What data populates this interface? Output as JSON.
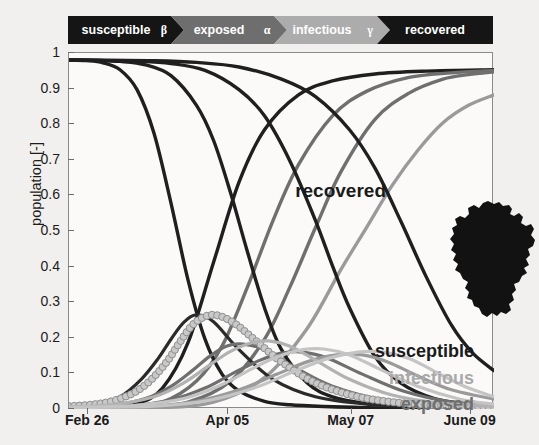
{
  "flow": {
    "stages": [
      {
        "name": "susceptible",
        "label": "susceptible",
        "param": "β",
        "color": "#151515"
      },
      {
        "name": "exposed",
        "label": "exposed",
        "param": "α",
        "color": "#6e6e6e"
      },
      {
        "name": "infectious",
        "label": "infectious",
        "param": "γ",
        "color": "#acacac"
      },
      {
        "name": "recovered",
        "label": "recovered",
        "param": "",
        "color": "#151515"
      }
    ]
  },
  "annotations": {
    "recovered": "recovered",
    "susceptible": "susceptible",
    "infectious": "infectious",
    "exposed": "exposed",
    "map": "germany-outline"
  },
  "chart_data": {
    "type": "line",
    "title": "",
    "xlabel": "",
    "ylabel": "population [-]",
    "xticklabels": [
      "Feb 26",
      "Apr 05",
      "May 07",
      "June 09"
    ],
    "xtick_positions": [
      0.045,
      0.375,
      0.665,
      0.945
    ],
    "yticklabels": [
      "0",
      "0.1",
      "0.2",
      "0.3",
      "0.4",
      "0.5",
      "0.6",
      "0.7",
      "0.8",
      "0.9",
      "1"
    ],
    "ylim": [
      0,
      1.02
    ],
    "xlim": [
      0,
      1
    ],
    "grid": false,
    "legend_position": "annotations-right",
    "colors": {
      "susceptible": "#1f1f1f",
      "exposed": "#6f6f6f",
      "infectious": "#b2b2b2",
      "recovered": "#1f1f1f",
      "infectious_marker_fill": "#c9c9c9",
      "infectious_marker_edge": "#8e8e8e"
    },
    "series": [
      {
        "name": "susceptible-1",
        "group": "susceptible",
        "color": "#1f1f1f",
        "width": 3.4,
        "x": [
          0.0,
          0.04,
          0.08,
          0.12,
          0.16,
          0.2,
          0.24,
          0.28,
          0.32,
          0.36,
          0.4,
          0.46,
          0.52,
          0.6,
          0.7,
          0.8,
          0.9,
          1.0
        ],
        "y": [
          1.0,
          0.998,
          0.992,
          0.972,
          0.915,
          0.79,
          0.59,
          0.37,
          0.2,
          0.1,
          0.052,
          0.022,
          0.012,
          0.007,
          0.004,
          0.003,
          0.003,
          0.003
        ]
      },
      {
        "name": "susceptible-2",
        "group": "susceptible",
        "color": "#1f1f1f",
        "width": 3.4,
        "x": [
          0.0,
          0.06,
          0.12,
          0.18,
          0.24,
          0.3,
          0.34,
          0.38,
          0.42,
          0.46,
          0.5,
          0.56,
          0.62,
          0.7,
          0.8,
          0.9,
          1.0
        ],
        "y": [
          1.0,
          0.999,
          0.996,
          0.986,
          0.955,
          0.87,
          0.77,
          0.62,
          0.45,
          0.29,
          0.17,
          0.075,
          0.035,
          0.016,
          0.008,
          0.006,
          0.005
        ]
      },
      {
        "name": "susceptible-3",
        "group": "susceptible",
        "color": "#1f1f1f",
        "width": 3.4,
        "x": [
          0.0,
          0.08,
          0.16,
          0.24,
          0.32,
          0.4,
          0.46,
          0.52,
          0.58,
          0.62,
          0.66,
          0.72,
          0.78,
          0.86,
          0.94,
          1.0
        ],
        "y": [
          1.0,
          0.999,
          0.997,
          0.99,
          0.97,
          0.915,
          0.84,
          0.71,
          0.54,
          0.41,
          0.29,
          0.15,
          0.075,
          0.03,
          0.015,
          0.011
        ]
      },
      {
        "name": "susceptible-4",
        "group": "susceptible",
        "color": "#1f1f1f",
        "width": 3.4,
        "x": [
          0.0,
          0.1,
          0.2,
          0.3,
          0.4,
          0.5,
          0.58,
          0.66,
          0.72,
          0.78,
          0.84,
          0.9,
          0.95,
          1.0
        ],
        "y": [
          1.0,
          0.999,
          0.998,
          0.993,
          0.98,
          0.945,
          0.895,
          0.8,
          0.69,
          0.54,
          0.38,
          0.24,
          0.16,
          0.11
        ]
      },
      {
        "name": "recovered-1",
        "group": "recovered",
        "color": "#1f1f1f",
        "width": 3.4,
        "x": [
          0.0,
          0.08,
          0.16,
          0.22,
          0.28,
          0.34,
          0.4,
          0.46,
          0.54,
          0.62,
          0.72,
          0.84,
          1.0
        ],
        "y": [
          0.0,
          0.002,
          0.015,
          0.06,
          0.19,
          0.42,
          0.65,
          0.8,
          0.9,
          0.94,
          0.96,
          0.968,
          0.972
        ]
      },
      {
        "name": "recovered-2",
        "group": "recovered",
        "color": "#6f6f6f",
        "width": 3.4,
        "x": [
          0.0,
          0.12,
          0.22,
          0.3,
          0.36,
          0.42,
          0.48,
          0.54,
          0.62,
          0.7,
          0.8,
          0.9,
          1.0
        ],
        "y": [
          0.0,
          0.003,
          0.02,
          0.08,
          0.18,
          0.35,
          0.54,
          0.7,
          0.84,
          0.91,
          0.95,
          0.963,
          0.97
        ]
      },
      {
        "name": "recovered-3",
        "group": "recovered",
        "color": "#6f6f6f",
        "width": 3.4,
        "x": [
          0.0,
          0.16,
          0.28,
          0.38,
          0.46,
          0.52,
          0.58,
          0.64,
          0.72,
          0.8,
          0.88,
          0.94,
          1.0
        ],
        "y": [
          0.0,
          0.003,
          0.02,
          0.08,
          0.2,
          0.35,
          0.52,
          0.68,
          0.83,
          0.905,
          0.945,
          0.958,
          0.966
        ]
      },
      {
        "name": "recovered-4",
        "group": "recovered",
        "color": "#9a9a9a",
        "width": 3.4,
        "x": [
          0.0,
          0.2,
          0.34,
          0.46,
          0.56,
          0.64,
          0.7,
          0.76,
          0.82,
          0.88,
          0.94,
          1.0
        ],
        "y": [
          0.0,
          0.003,
          0.02,
          0.09,
          0.23,
          0.4,
          0.52,
          0.64,
          0.74,
          0.82,
          0.87,
          0.9
        ]
      },
      {
        "name": "exposed-1",
        "group": "exposed",
        "color": "#2a2a2a",
        "width": 3.2,
        "x": [
          0.0,
          0.06,
          0.12,
          0.17,
          0.21,
          0.24,
          0.27,
          0.3,
          0.34,
          0.4,
          0.48,
          0.58,
          0.7,
          0.85,
          1.0
        ],
        "y": [
          0.005,
          0.012,
          0.035,
          0.085,
          0.145,
          0.2,
          0.248,
          0.27,
          0.25,
          0.17,
          0.085,
          0.035,
          0.014,
          0.006,
          0.004
        ]
      },
      {
        "name": "exposed-2",
        "group": "exposed",
        "color": "#6f6f6f",
        "width": 3.2,
        "x": [
          0.0,
          0.1,
          0.18,
          0.24,
          0.29,
          0.33,
          0.37,
          0.41,
          0.46,
          0.53,
          0.62,
          0.74,
          0.88,
          1.0
        ],
        "y": [
          0.004,
          0.01,
          0.03,
          0.065,
          0.11,
          0.15,
          0.18,
          0.186,
          0.17,
          0.12,
          0.065,
          0.026,
          0.01,
          0.006
        ]
      },
      {
        "name": "exposed-3",
        "group": "exposed",
        "color": "#6f6f6f",
        "width": 3.2,
        "x": [
          0.0,
          0.14,
          0.24,
          0.32,
          0.39,
          0.45,
          0.5,
          0.55,
          0.61,
          0.69,
          0.79,
          0.9,
          1.0
        ],
        "y": [
          0.003,
          0.008,
          0.026,
          0.06,
          0.105,
          0.14,
          0.16,
          0.163,
          0.145,
          0.1,
          0.05,
          0.02,
          0.01
        ]
      },
      {
        "name": "exposed-4",
        "group": "exposed",
        "color": "#9a9a9a",
        "width": 3.2,
        "x": [
          0.0,
          0.18,
          0.3,
          0.4,
          0.49,
          0.56,
          0.63,
          0.69,
          0.75,
          0.82,
          0.9,
          1.0
        ],
        "y": [
          0.003,
          0.007,
          0.022,
          0.055,
          0.1,
          0.135,
          0.155,
          0.155,
          0.135,
          0.095,
          0.055,
          0.028
        ]
      },
      {
        "name": "infectious-1",
        "group": "infectious",
        "color": "#b2b2b2",
        "width": 3.2,
        "marker": "circle",
        "x": [
          0.0,
          0.05,
          0.1,
          0.15,
          0.19,
          0.23,
          0.26,
          0.29,
          0.32,
          0.35,
          0.39,
          0.44,
          0.5,
          0.58,
          0.68,
          0.8,
          0.92,
          1.0
        ],
        "y": [
          0.008,
          0.012,
          0.022,
          0.045,
          0.08,
          0.135,
          0.19,
          0.24,
          0.265,
          0.268,
          0.245,
          0.195,
          0.135,
          0.075,
          0.035,
          0.015,
          0.008,
          0.006
        ]
      },
      {
        "name": "infectious-2",
        "group": "infectious",
        "color": "#b2b2b2",
        "width": 3.2,
        "x": [
          0.0,
          0.1,
          0.2,
          0.27,
          0.33,
          0.38,
          0.43,
          0.47,
          0.52,
          0.58,
          0.66,
          0.76,
          0.88,
          1.0
        ],
        "y": [
          0.006,
          0.012,
          0.035,
          0.075,
          0.125,
          0.165,
          0.19,
          0.195,
          0.18,
          0.14,
          0.085,
          0.04,
          0.016,
          0.008
        ]
      },
      {
        "name": "infectious-3",
        "group": "infectious",
        "color": "#c4c4c4",
        "width": 3.2,
        "x": [
          0.0,
          0.15,
          0.27,
          0.36,
          0.43,
          0.49,
          0.55,
          0.6,
          0.66,
          0.73,
          0.82,
          0.92,
          1.0
        ],
        "y": [
          0.005,
          0.01,
          0.03,
          0.07,
          0.115,
          0.15,
          0.17,
          0.172,
          0.155,
          0.115,
          0.065,
          0.028,
          0.014
        ]
      },
      {
        "name": "infectious-4",
        "group": "infectious",
        "color": "#c4c4c4",
        "width": 3.2,
        "x": [
          0.0,
          0.2,
          0.33,
          0.44,
          0.53,
          0.61,
          0.68,
          0.74,
          0.8,
          0.86,
          0.93,
          1.0
        ],
        "y": [
          0.004,
          0.008,
          0.025,
          0.062,
          0.108,
          0.145,
          0.163,
          0.163,
          0.145,
          0.108,
          0.065,
          0.035
        ]
      }
    ]
  }
}
